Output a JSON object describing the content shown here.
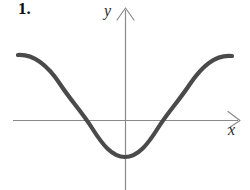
{
  "figure": {
    "problem_number": "1.",
    "background_color": "#ffffff",
    "width": 250,
    "height": 190
  },
  "axes": {
    "x_label": "x",
    "y_label": "y",
    "axis_color": "#8a8a8a",
    "axis_stroke_width": 1.2,
    "origin": {
      "x": 125,
      "y": 120
    },
    "x_axis": {
      "start_x": 13,
      "end_x": 240,
      "y": 120,
      "arrow": "right-open"
    },
    "y_axis": {
      "x": 125,
      "start_y": 190,
      "end_y": 8,
      "arrow": "up-open"
    }
  },
  "chart_data": {
    "type": "line",
    "title": "",
    "xlabel": "x",
    "ylabel": "y",
    "grid": false,
    "legend": null,
    "axis_arrows": true,
    "curve_color": "#4a4a4a",
    "curve_width": 4.2,
    "shape": "cosine",
    "x": [
      18,
      30,
      45,
      60,
      75,
      85,
      95,
      110,
      125,
      140,
      155,
      166,
      180,
      196,
      212,
      232
    ],
    "y": [
      55,
      58,
      68,
      84,
      104,
      120,
      134,
      151,
      157,
      151,
      134,
      120,
      101,
      77,
      62,
      56
    ],
    "key_points": {
      "left_endpoint": {
        "x": 18,
        "y": 55
      },
      "right_endpoint": {
        "x": 232,
        "y": 56
      },
      "minimum": {
        "x": 125,
        "y": 157
      },
      "x_intercepts": [
        {
          "x": 85,
          "y": 120
        },
        {
          "x": 166,
          "y": 120
        }
      ]
    },
    "path_d": "M 18 55 C 34 54 48 66 60 84 C 72 102 82 112 92 128 C 102 144 112 157 125 157 C 138 157 148 144 158 128 C 168 112 178 102 190 84 C 202 66 216 54 232 56"
  }
}
